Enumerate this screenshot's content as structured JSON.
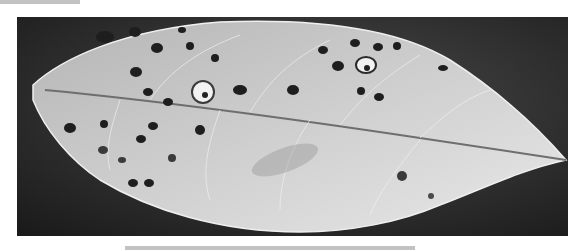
{
  "image": {
    "subject": "leaf with dark disease spots",
    "style": "grayscale photograph",
    "background_color": "#2a2a2a",
    "leaf_color": "#d9d9d9",
    "spot_color": "#1e1e1e"
  },
  "spots": [
    {
      "cx": 105,
      "cy": 37,
      "rx": 9,
      "ry": 6
    },
    {
      "cx": 135,
      "cy": 32,
      "rx": 6,
      "ry": 5
    },
    {
      "cx": 157,
      "cy": 48,
      "rx": 6,
      "ry": 5
    },
    {
      "cx": 136,
      "cy": 72,
      "rx": 6,
      "ry": 5
    },
    {
      "cx": 148,
      "cy": 92,
      "rx": 5,
      "ry": 4
    },
    {
      "cx": 168,
      "cy": 102,
      "rx": 5,
      "ry": 4
    },
    {
      "cx": 190,
      "cy": 46,
      "rx": 4,
      "ry": 4
    },
    {
      "cx": 215,
      "cy": 58,
      "rx": 4,
      "ry": 4
    },
    {
      "cx": 240,
      "cy": 90,
      "rx": 7,
      "ry": 5
    },
    {
      "cx": 182,
      "cy": 30,
      "rx": 4,
      "ry": 3
    },
    {
      "cx": 293,
      "cy": 90,
      "rx": 6,
      "ry": 5
    },
    {
      "cx": 323,
      "cy": 50,
      "rx": 5,
      "ry": 4
    },
    {
      "cx": 338,
      "cy": 66,
      "rx": 6,
      "ry": 5
    },
    {
      "cx": 355,
      "cy": 43,
      "rx": 5,
      "ry": 4
    },
    {
      "cx": 378,
      "cy": 47,
      "rx": 5,
      "ry": 4
    },
    {
      "cx": 397,
      "cy": 46,
      "rx": 4,
      "ry": 4
    },
    {
      "cx": 361,
      "cy": 91,
      "rx": 4,
      "ry": 4
    },
    {
      "cx": 379,
      "cy": 97,
      "rx": 5,
      "ry": 4
    },
    {
      "cx": 443,
      "cy": 68,
      "rx": 5,
      "ry": 3
    },
    {
      "cx": 70,
      "cy": 128,
      "rx": 6,
      "ry": 5
    },
    {
      "cx": 104,
      "cy": 124,
      "rx": 4,
      "ry": 4
    },
    {
      "cx": 141,
      "cy": 139,
      "rx": 5,
      "ry": 4
    },
    {
      "cx": 153,
      "cy": 126,
      "rx": 5,
      "ry": 4
    },
    {
      "cx": 200,
      "cy": 130,
      "rx": 5,
      "ry": 5
    },
    {
      "cx": 103,
      "cy": 150,
      "rx": 5,
      "ry": 4
    },
    {
      "cx": 122,
      "cy": 160,
      "rx": 4,
      "ry": 3
    },
    {
      "cx": 172,
      "cy": 158,
      "rx": 4,
      "ry": 4
    },
    {
      "cx": 133,
      "cy": 183,
      "rx": 5,
      "ry": 4
    },
    {
      "cx": 149,
      "cy": 183,
      "rx": 5,
      "ry": 4
    },
    {
      "cx": 402,
      "cy": 176,
      "rx": 5,
      "ry": 5
    },
    {
      "cx": 431,
      "cy": 196,
      "rx": 3,
      "ry": 3
    }
  ],
  "lesions": [
    {
      "cx": 203,
      "cy": 92,
      "rx": 11,
      "ry": 11
    },
    {
      "cx": 366,
      "cy": 65,
      "rx": 10,
      "ry": 8
    }
  ]
}
